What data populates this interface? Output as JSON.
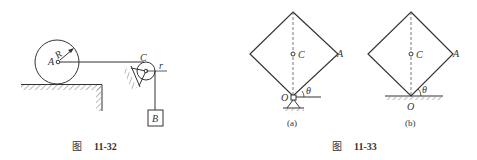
{
  "figures": [
    {
      "caption_prefix": "图",
      "caption_number": "11-32",
      "labels": {
        "A": "A",
        "R": "R",
        "C": "C",
        "r": "r",
        "B": "B"
      }
    },
    {
      "caption_prefix": "图",
      "caption_number": "11-33",
      "subfigures": [
        {
          "tag": "(a)",
          "labels": {
            "C": "C",
            "A": "A",
            "O": "O",
            "theta": "θ"
          }
        },
        {
          "tag": "(b)",
          "labels": {
            "C": "C",
            "A": "A",
            "O": "O",
            "theta": "θ"
          }
        }
      ]
    }
  ],
  "colors": {
    "line": "#333333",
    "hatch": "#777777"
  }
}
